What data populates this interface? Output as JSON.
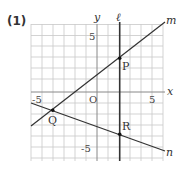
{
  "problem_label": "(1)",
  "axes": {
    "x_label": "x",
    "y_label": "y",
    "origin_label": "O",
    "x_tick_pos": "5",
    "x_tick_neg": "-5",
    "y_tick_pos": "5",
    "y_tick_neg": "-5"
  },
  "lines": {
    "l": {
      "label": "ℓ",
      "description": "vertical line x = 2"
    },
    "m": {
      "label": "m"
    },
    "n": {
      "label": "n"
    }
  },
  "points": {
    "P": {
      "label": "P",
      "x": 2,
      "y": 3
    },
    "Q": {
      "label": "Q",
      "x": -4,
      "y": -2
    },
    "R": {
      "label": "R",
      "x": 2,
      "y": -4
    }
  },
  "colors": {
    "grid": "#c8c8c8",
    "axis": "#888888",
    "line": "#333333"
  }
}
